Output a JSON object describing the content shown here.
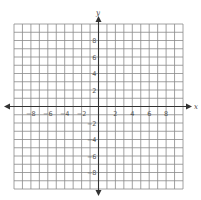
{
  "graph": {
    "title": "Coordinate plane",
    "x_axis": {
      "label": "x",
      "min": -10,
      "max": 10,
      "tick_labels": [
        "−8",
        "−6",
        "−4",
        "−2",
        "2",
        "4",
        "6",
        "8"
      ],
      "tick_values": [
        -8,
        -6,
        -4,
        -2,
        2,
        4,
        6,
        8
      ]
    },
    "y_axis": {
      "label": "y",
      "min": -10,
      "max": 10,
      "tick_labels": [
        "8",
        "6",
        "4",
        "2",
        "−2",
        "−4",
        "−6",
        "−8"
      ],
      "tick_values": [
        8,
        6,
        4,
        2,
        -2,
        -4,
        -6,
        -8
      ]
    },
    "grid_cells": 20,
    "colors": {
      "grid": "#8a8a8a",
      "axis": "#333333",
      "label": "#555555"
    }
  }
}
